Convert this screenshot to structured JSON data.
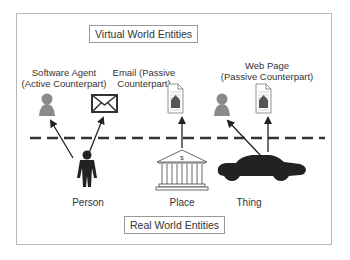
{
  "diagram": {
    "virtual_title": "Virtual World Entities",
    "real_title": "Real World Entities",
    "virtual_entities": [
      {
        "label_line1": "Software Agent",
        "label_line2": "(Active Counterpart)",
        "icon": "user-silhouette-icon"
      },
      {
        "label_line1": "Email (Passive",
        "label_line2": "Counterpart)",
        "icon": "envelope-icon"
      },
      {
        "label_line1": "",
        "label_line2": "",
        "icon": "web-page-document-icon"
      },
      {
        "label_line1": "",
        "label_line2": "",
        "icon": "user-silhouette-icon"
      },
      {
        "label_line1": "Web Page",
        "label_line2": "(Passive Counterpart)",
        "icon": "web-page-document-icon"
      }
    ],
    "real_entities": [
      {
        "label": "Person",
        "icon": "person-figure-icon"
      },
      {
        "label": "Place",
        "icon": "bank-building-icon",
        "symbol": "$"
      },
      {
        "label": "Thing",
        "icon": "car-icon"
      }
    ],
    "divider": "dashed-line",
    "colors": {
      "line": "#333333",
      "icon_gray": "#8a8a8a",
      "dark": "#222222",
      "frame": "#b8b8b8"
    }
  }
}
